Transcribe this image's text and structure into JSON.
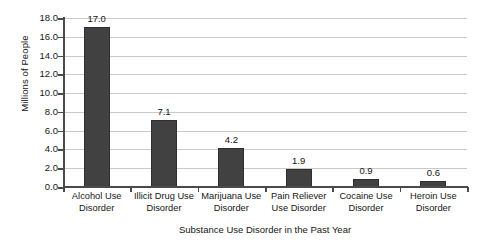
{
  "chart_data": {
    "type": "bar",
    "title": "",
    "xlabel": "Substance Use Disorder in the Past Year",
    "ylabel": "Millions of People",
    "categories": [
      "Alcohol Use Disorder",
      "Illicit Drug Use Disorder",
      "Marijuana Use Disorder",
      "Pain Reliever Use Disorder",
      "Cocaine Use Disorder",
      "Heroin Use Disorder"
    ],
    "category_lines": [
      [
        "Alcohol Use",
        "Disorder"
      ],
      [
        "Illicit Drug Use",
        "Disorder"
      ],
      [
        "Marijuana Use",
        "Disorder"
      ],
      [
        "Pain Reliever",
        "Use Disorder"
      ],
      [
        "Cocaine Use",
        "Disorder"
      ],
      [
        "Heroin Use",
        "Disorder"
      ]
    ],
    "values": [
      17.0,
      7.1,
      4.2,
      1.9,
      0.9,
      0.6
    ],
    "value_labels": [
      "17.0",
      "7.1",
      "4.2",
      "1.9",
      "0.9",
      "0.6"
    ],
    "ylim": [
      0.0,
      18.0
    ],
    "ytick_step": 2.0,
    "ytick_labels": [
      "18.0",
      "16.0",
      "14.0",
      "12.0",
      "10.0",
      "8.0",
      "6.0",
      "4.0",
      "2.0",
      "0.0"
    ],
    "grid": true,
    "legend": "none",
    "bar_color": "#414141",
    "gridline_color": "#c9c9c9",
    "axis_color": "#4a4a4a",
    "background_color": "#ffffff"
  }
}
